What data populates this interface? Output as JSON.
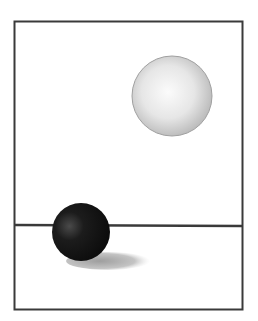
{
  "figure": {
    "frame": {
      "x": 14,
      "y": 21,
      "width": 229,
      "height": 289,
      "stroke": "#3a3a3a"
    },
    "horizon_line": {
      "y": 225,
      "x1": 14,
      "x2": 242,
      "stroke": "#3a3a3a"
    },
    "light_sphere": {
      "cx": 172,
      "cy": 96,
      "r": 40,
      "fill": "#e8e8e8",
      "edge": "#9a9a9a"
    },
    "dark_sphere": {
      "cx": 81,
      "cy": 232,
      "r": 29,
      "fill": "#151515",
      "highlight": "#5a5a5a"
    },
    "shadow": {
      "cx": 110,
      "cy": 262,
      "rx": 40,
      "ry": 9,
      "fill": "#b8b8b8"
    }
  }
}
